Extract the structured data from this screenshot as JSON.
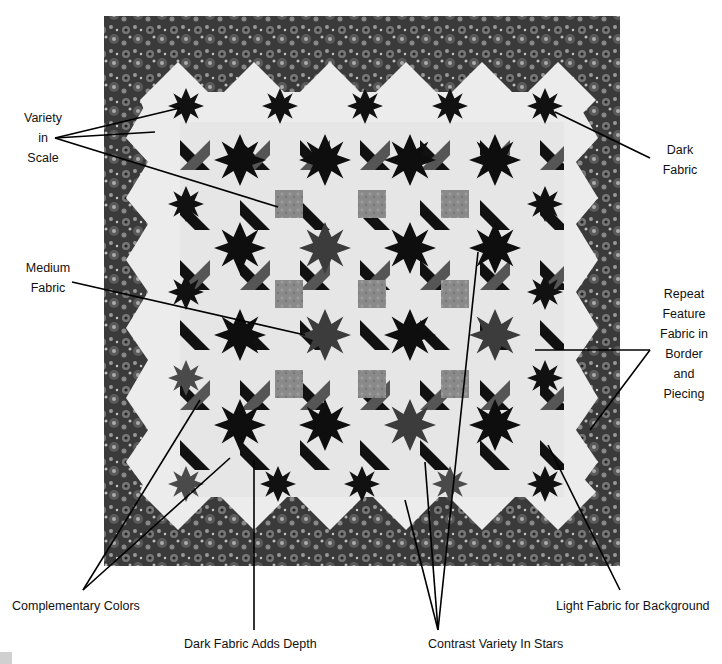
{
  "figure": {
    "colors": {
      "border_dark": "#2b2b2b",
      "border_mid": "#6a6a6a",
      "background_light": "#ececec",
      "star_dark": "#111111",
      "star_medium": "#555555",
      "block_medium": "#8c8c8c",
      "leader_line": "#000000"
    }
  },
  "annotations": {
    "variety_in_scale": {
      "text": "Variety\nin\nScale"
    },
    "dark_fabric": {
      "text": "Dark\nFabric"
    },
    "medium_fabric": {
      "text": "Medium\nFabric"
    },
    "repeat_feature": {
      "text": "Repeat\nFeature\nFabric in\nBorder\nand\nPiecing"
    },
    "complementary_colors": {
      "text": "Complementary Colors"
    },
    "dark_fabric_adds_depth": {
      "text": "Dark Fabric Adds Depth"
    },
    "contrast_variety_in_stars": {
      "text": "Contrast Variety In Stars"
    },
    "light_fabric_for_background": {
      "text": "Light Fabric for Background"
    }
  }
}
